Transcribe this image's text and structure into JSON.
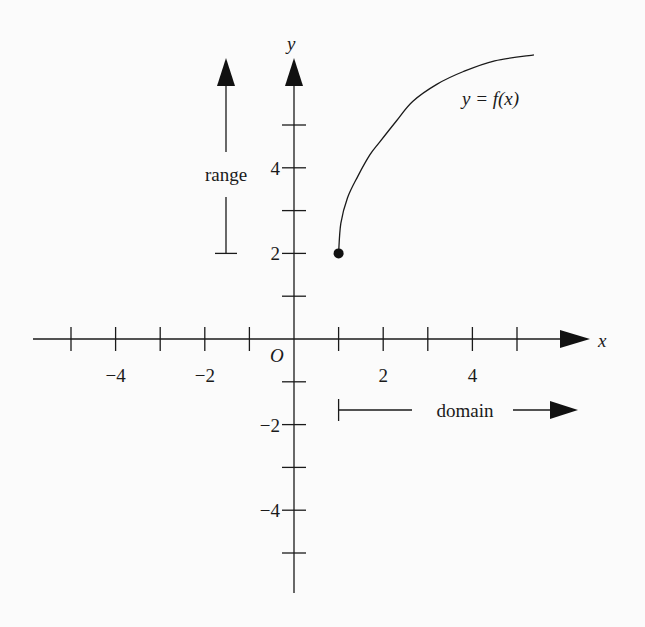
{
  "chart_data": {
    "type": "line",
    "title": "",
    "xlabel": "x",
    "ylabel": "y",
    "origin_label": "O",
    "xlim": [
      -6,
      6.5
    ],
    "ylim": [
      -6,
      6.5
    ],
    "x_ticks": [
      -5,
      -4,
      -3,
      -2,
      -1,
      1,
      2,
      3,
      4,
      5
    ],
    "y_ticks": [
      -5,
      -4,
      -3,
      -2,
      -1,
      1,
      2,
      3,
      4,
      5
    ],
    "x_tick_labels": [
      {
        "v": -4,
        "t": "−4"
      },
      {
        "v": -2,
        "t": "−2"
      },
      {
        "v": 2,
        "t": "2"
      },
      {
        "v": 4,
        "t": "4"
      }
    ],
    "y_tick_labels": [
      {
        "v": 4,
        "t": "4"
      },
      {
        "v": 2,
        "t": "2"
      },
      {
        "v": -2,
        "t": "−2"
      },
      {
        "v": -4,
        "t": "−4"
      }
    ],
    "series": [
      {
        "name": "y = f(x)",
        "start_point": {
          "x": 1,
          "y": 2,
          "closed": true
        },
        "points": [
          [
            1,
            2
          ],
          [
            1.05,
            2.7
          ],
          [
            1.2,
            3.3
          ],
          [
            1.43,
            3.8
          ],
          [
            1.7,
            4.3
          ],
          [
            1.92,
            4.6
          ],
          [
            2.3,
            5.1
          ],
          [
            2.66,
            5.55
          ],
          [
            3.2,
            5.95
          ],
          [
            3.8,
            6.25
          ],
          [
            4.5,
            6.5
          ],
          [
            5.38,
            6.64
          ]
        ]
      }
    ],
    "annotations": {
      "curve_label": "y = f(x)",
      "range_label": "range",
      "domain_label": "domain",
      "range_from": 2,
      "domain_from": 1
    }
  }
}
